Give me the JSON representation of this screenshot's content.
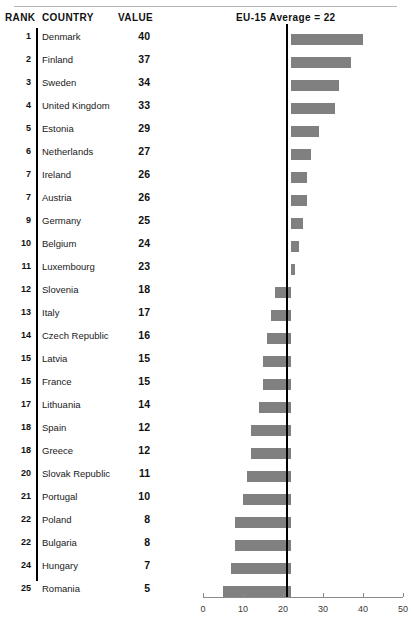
{
  "table": {
    "headers": {
      "rank": "RANK",
      "country": "COUNTRY",
      "value": "VALUE"
    }
  },
  "chart_header": {
    "label": "EU-15 Average = 22"
  },
  "colors": {
    "bar": "#808080",
    "reference_line": "#000000",
    "axis": "#8a8a8a",
    "text": "#1a1a1a"
  },
  "chart_data": {
    "type": "bar",
    "title": "EU-15 Average = 22",
    "xlabel": "",
    "ylabel": "",
    "xlim": [
      0,
      50
    ],
    "xticks": [
      0,
      10,
      20,
      30,
      40,
      50
    ],
    "reference_value": 22,
    "reference_label": "EU-15 Average = 22",
    "orientation": "horizontal",
    "grid": false,
    "legend": false,
    "categories": [
      "Denmark",
      "Finland",
      "Sweden",
      "United Kingdom",
      "Estonia",
      "Netherlands",
      "Ireland",
      "Austria",
      "Germany",
      "Belgium",
      "Luxembourg",
      "Slovenia",
      "Italy",
      "Czech Republic",
      "Latvia",
      "France",
      "Lithuania",
      "Spain",
      "Greece",
      "Slovak Republic",
      "Portugal",
      "Poland",
      "Bulgaria",
      "Hungary",
      "Romania"
    ],
    "values": [
      40,
      37,
      34,
      33,
      29,
      27,
      26,
      26,
      25,
      24,
      23,
      18,
      17,
      16,
      15,
      15,
      14,
      12,
      12,
      11,
      10,
      8,
      8,
      7,
      5
    ],
    "ranks": [
      1,
      2,
      3,
      4,
      5,
      6,
      7,
      7,
      9,
      10,
      11,
      12,
      13,
      14,
      15,
      15,
      17,
      18,
      18,
      20,
      21,
      22,
      22,
      24,
      25
    ]
  },
  "rows": [
    {
      "rank": "1",
      "country": "Denmark",
      "value": "40"
    },
    {
      "rank": "2",
      "country": "Finland",
      "value": "37"
    },
    {
      "rank": "3",
      "country": "Sweden",
      "value": "34"
    },
    {
      "rank": "4",
      "country": "United Kingdom",
      "value": "33"
    },
    {
      "rank": "5",
      "country": "Estonia",
      "value": "29"
    },
    {
      "rank": "6",
      "country": "Netherlands",
      "value": "27"
    },
    {
      "rank": "7",
      "country": "Ireland",
      "value": "26"
    },
    {
      "rank": "7",
      "country": "Austria",
      "value": "26"
    },
    {
      "rank": "9",
      "country": "Germany",
      "value": "25"
    },
    {
      "rank": "10",
      "country": "Belgium",
      "value": "24"
    },
    {
      "rank": "11",
      "country": "Luxembourg",
      "value": "23"
    },
    {
      "rank": "12",
      "country": "Slovenia",
      "value": "18"
    },
    {
      "rank": "13",
      "country": "Italy",
      "value": "17"
    },
    {
      "rank": "14",
      "country": "Czech Republic",
      "value": "16"
    },
    {
      "rank": "15",
      "country": "Latvia",
      "value": "15"
    },
    {
      "rank": "15",
      "country": "France",
      "value": "15"
    },
    {
      "rank": "17",
      "country": "Lithuania",
      "value": "14"
    },
    {
      "rank": "18",
      "country": "Spain",
      "value": "12"
    },
    {
      "rank": "18",
      "country": "Greece",
      "value": "12"
    },
    {
      "rank": "20",
      "country": "Slovak Republic",
      "value": "11"
    },
    {
      "rank": "21",
      "country": "Portugal",
      "value": "10"
    },
    {
      "rank": "22",
      "country": "Poland",
      "value": "8"
    },
    {
      "rank": "22",
      "country": "Bulgaria",
      "value": "8"
    },
    {
      "rank": "24",
      "country": "Hungary",
      "value": "7"
    },
    {
      "rank": "25",
      "country": "Romania",
      "value": "5"
    }
  ],
  "axis": {
    "ticks": [
      "0",
      "10",
      "20",
      "30",
      "40",
      "50"
    ]
  }
}
